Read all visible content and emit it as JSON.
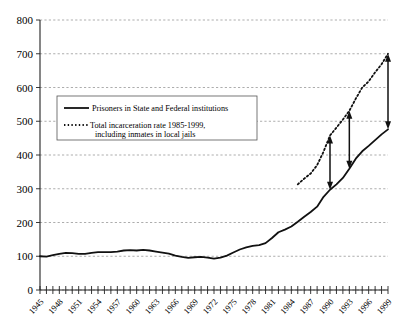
{
  "chart_data": {
    "type": "line",
    "title": "",
    "xlabel": "",
    "ylabel": "",
    "xlim": [
      1945,
      1999
    ],
    "ylim": [
      0,
      800
    ],
    "yticks": [
      0,
      100,
      200,
      300,
      400,
      500,
      600,
      700,
      800
    ],
    "xticks": [
      1945,
      1948,
      1951,
      1954,
      1957,
      1960,
      1963,
      1966,
      1969,
      1972,
      1975,
      1978,
      1981,
      1984,
      1987,
      1990,
      1993,
      1996,
      1999
    ],
    "grid": true,
    "legend_position": "upper-left-inside",
    "series": [
      {
        "name": "Prisoners in State and Federal institutions",
        "style": "solid",
        "x": [
          1945,
          1946,
          1947,
          1948,
          1949,
          1950,
          1951,
          1952,
          1953,
          1954,
          1955,
          1956,
          1957,
          1958,
          1959,
          1960,
          1961,
          1962,
          1963,
          1964,
          1965,
          1966,
          1967,
          1968,
          1969,
          1970,
          1971,
          1972,
          1973,
          1974,
          1975,
          1976,
          1977,
          1978,
          1979,
          1980,
          1981,
          1982,
          1983,
          1984,
          1985,
          1986,
          1987,
          1988,
          1989,
          1990,
          1991,
          1992,
          1993,
          1994,
          1995,
          1996,
          1997,
          1998,
          1999
        ],
        "values": [
          100,
          99,
          103,
          107,
          110,
          109,
          107,
          107,
          110,
          112,
          112,
          112,
          114,
          117,
          118,
          117,
          119,
          117,
          114,
          111,
          108,
          102,
          98,
          95,
          97,
          98,
          96,
          93,
          96,
          102,
          111,
          120,
          126,
          131,
          133,
          139,
          154,
          171,
          179,
          188,
          202,
          217,
          231,
          247,
          276,
          297,
          313,
          332,
          359,
          389,
          411,
          427,
          444,
          461,
          476
        ]
      },
      {
        "name": "Total incarceration rate 1985-1999, including inmates in local jails",
        "style": "dotted",
        "x": [
          1985,
          1986,
          1987,
          1988,
          1989,
          1990,
          1991,
          1992,
          1993,
          1994,
          1995,
          1996,
          1997,
          1998,
          1999
        ],
        "values": [
          313,
          330,
          345,
          370,
          410,
          458,
          481,
          505,
          531,
          567,
          600,
          618,
          645,
          669,
          700
        ]
      }
    ],
    "annotations": [
      {
        "name": "gap-arrow-1990",
        "year": 1990,
        "from_value": 297,
        "to_value": 458,
        "heads": "both"
      },
      {
        "name": "gap-arrow-1993",
        "year": 1993,
        "from_value": 359,
        "to_value": 531,
        "heads": "both"
      },
      {
        "name": "gap-arrow-1999",
        "year": 1999,
        "from_value": 476,
        "to_value": 700,
        "heads": "both"
      }
    ],
    "legend_entries": [
      {
        "label": "Prisoners in State and Federal institutions",
        "style": "solid"
      },
      {
        "label": "Total incarceration rate 1985-1999,",
        "label2": "including inmates in local jails",
        "style": "dotted"
      }
    ],
    "colors": {
      "line": "#111111",
      "grid": "#8a8a8a",
      "axis": "#222222",
      "background": "#ffffff"
    }
  },
  "legend": {
    "entry1_label": "Prisoners in State and Federal institutions",
    "entry2_label_line1": "Total incarceration rate 1985-1999,",
    "entry2_label_line2": "including inmates in local jails"
  },
  "axes": {
    "y_labels": [
      "800",
      "700",
      "600",
      "500",
      "400",
      "300",
      "200",
      "100",
      "0"
    ],
    "x_labels": [
      "1945",
      "1948",
      "1951",
      "1954",
      "1957",
      "1960",
      "1963",
      "1966",
      "1969",
      "1972",
      "1975",
      "1978",
      "1981",
      "1984",
      "1987",
      "1990",
      "1993",
      "1996",
      "1999"
    ]
  }
}
